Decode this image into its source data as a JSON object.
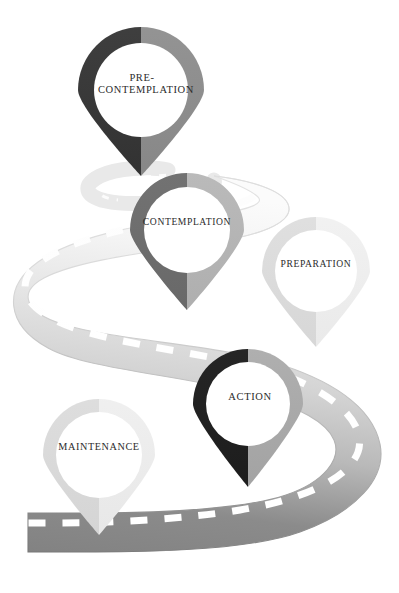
{
  "diagram": {
    "background_color": "#ffffff",
    "road": {
      "description": "winding road receding into the distance",
      "near_color": "#8b8b8b",
      "mid_color": "#d2d2d2",
      "far_color": "#f4f4f4",
      "outline_color": "#c9c9c9",
      "dash_color": "#ffffff"
    },
    "pins": [
      {
        "id": "pre-contemplation",
        "label": "PRE-\nCONTEMPLATION",
        "order": 1,
        "left_color": "#3b3b3b",
        "right_color": "#8d8d8d",
        "center_color": "#ffffff",
        "cx": 141,
        "cy": 90,
        "r": 63,
        "tip_y": 176
      },
      {
        "id": "contemplation",
        "label": "CONTEMPLATION",
        "order": 2,
        "left_color": "#6e6e6e",
        "right_color": "#b4b4b4",
        "center_color": "#ffffff",
        "cx": 187,
        "cy": 230,
        "r": 57,
        "tip_y": 310
      },
      {
        "id": "preparation",
        "label": "PREPARATION",
        "order": 3,
        "left_color": "#dcdcdc",
        "right_color": "#efefef",
        "center_color": "#ffffff",
        "cx": 316,
        "cy": 271,
        "r": 54,
        "tip_y": 347
      },
      {
        "id": "action",
        "label": "ACTION",
        "order": 4,
        "left_color": "#232323",
        "right_color": "#a9a9a9",
        "center_color": "#ffffff",
        "cx": 248,
        "cy": 404,
        "r": 55,
        "tip_y": 487
      },
      {
        "id": "maintenance",
        "label": "MAINTENANCE",
        "order": 5,
        "left_color": "#dadada",
        "right_color": "#ededed",
        "center_color": "#ffffff",
        "cx": 99,
        "cy": 455,
        "r": 56,
        "tip_y": 535
      }
    ]
  }
}
